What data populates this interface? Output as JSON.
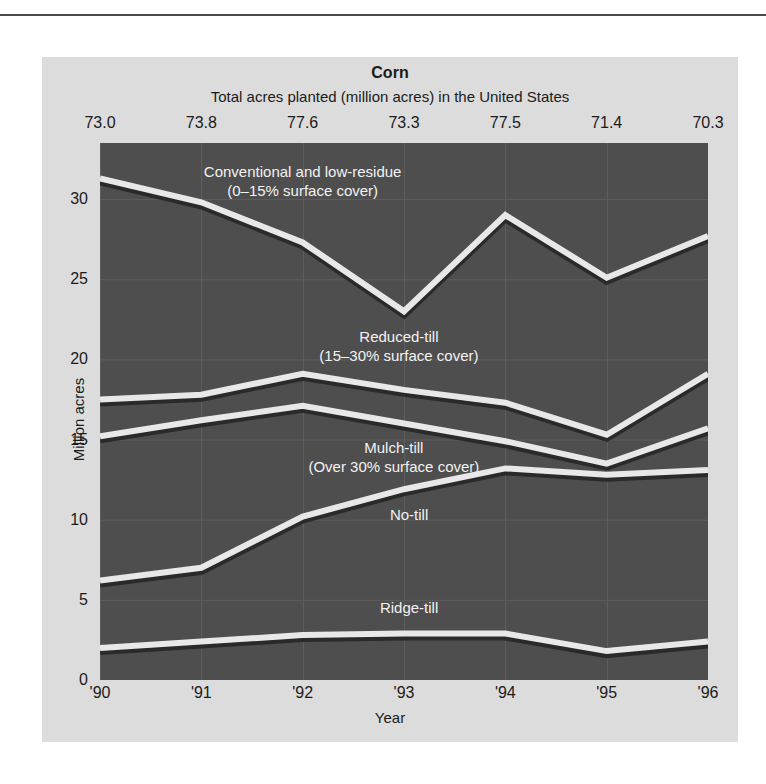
{
  "figure": {
    "title": "Corn",
    "subtitle": "Total acres planted (million acres) in the United States",
    "yaxis_title": "Million acres",
    "xaxis_title": "Year"
  },
  "top_values": [
    "73.0",
    "73.8",
    "77.6",
    "73.3",
    "77.5",
    "71.4",
    "70.3"
  ],
  "y_ticks": [
    "0",
    "5",
    "10",
    "15",
    "20",
    "25",
    "30"
  ],
  "x_ticks": [
    "'90",
    "'91",
    "'92",
    "'93",
    "'94",
    "'95",
    "'96"
  ],
  "series_labels": {
    "conventional_line1": "Conventional and low-residue",
    "conventional_line2": "(0–15% surface cover)",
    "reduced_line1": "Reduced-till",
    "reduced_line2": "(15–30% surface cover)",
    "mulch_line1": "Mulch-till",
    "mulch_line2": "(Over 30% surface cover)",
    "notill": "No-till",
    "ridgetill": "Ridge-till"
  },
  "colors": {
    "panel": "#dcdcdc",
    "plot_background": "#4e4e4e",
    "line": "#e8e8e8",
    "grid": "#5e5e5e",
    "text_dark": "#1b1b1b",
    "text_light": "#f2f2f2"
  },
  "chart_data": {
    "type": "line",
    "title": "Corn",
    "subtitle": "Total acres planted (million acres) in the United States",
    "xlabel": "Year",
    "ylabel": "Million acres",
    "x": [
      "'90",
      "'91",
      "'92",
      "'93",
      "'94",
      "'95",
      "'96"
    ],
    "xlim": [
      0,
      6
    ],
    "ylim": [
      0,
      33.5
    ],
    "y_ticks": [
      0,
      5,
      10,
      15,
      20,
      25,
      30
    ],
    "grid": true,
    "legend": "inline-labels",
    "annotations": {
      "top_row_label": "Total acres planted (million acres) in the United States",
      "top_row_values": [
        73.0,
        73.8,
        77.6,
        73.3,
        77.5,
        71.4,
        70.3
      ]
    },
    "series": [
      {
        "name": "Conventional and low-residue (0–15% surface cover)",
        "values": [
          31.3,
          29.8,
          27.3,
          23.0,
          29.0,
          25.1,
          27.7
        ]
      },
      {
        "name": "Reduced-till (15–30% surface cover)",
        "values": [
          17.5,
          17.8,
          19.1,
          18.1,
          17.3,
          15.3,
          19.1
        ]
      },
      {
        "name": "Mulch-till (Over 30% surface cover)",
        "values": [
          15.2,
          16.2,
          17.1,
          16.0,
          14.9,
          13.5,
          15.7
        ]
      },
      {
        "name": "No-till",
        "values": [
          6.2,
          7.0,
          10.2,
          11.9,
          13.2,
          12.8,
          13.1
        ]
      },
      {
        "name": "Ridge-till",
        "values": [
          2.0,
          2.4,
          2.8,
          2.9,
          2.9,
          1.8,
          2.4
        ]
      }
    ]
  }
}
